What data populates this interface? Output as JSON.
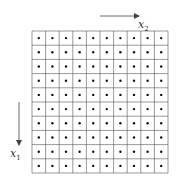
{
  "diagram": {
    "title": "",
    "grid": {
      "rows": 10,
      "cols": 10,
      "left": 32,
      "top": 31,
      "right": 168,
      "bottom": 173,
      "line_color": "#555555",
      "dot_color": "#111111",
      "dot_radius": 1.2
    },
    "axes": [
      {
        "name": "x2",
        "label": "x",
        "subscript": "2",
        "direction": "right",
        "arrow": {
          "x1": 100,
          "y1": 16,
          "x2": 139,
          "y2": 16
        },
        "label_pos": {
          "x": 138,
          "y": 28
        }
      },
      {
        "name": "x1",
        "label": "x",
        "subscript": "1",
        "direction": "down",
        "arrow": {
          "x1": 19,
          "y1": 102,
          "x2": 19,
          "y2": 145
        },
        "label_pos": {
          "x": 10,
          "y": 157
        }
      }
    ]
  }
}
